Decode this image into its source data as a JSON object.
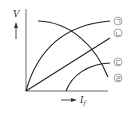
{
  "diagram": {
    "y_axis_label": "V",
    "x_axis_label_main": "I",
    "x_axis_label_sub": "f",
    "curves": [
      {
        "id": "a",
        "label": "ㄱ",
        "shape": "rising concave from origin"
      },
      {
        "id": "b",
        "label": "ㄴ",
        "shape": "straight line from origin"
      },
      {
        "id": "c",
        "label": "ㄷ",
        "shape": "rising concave from offset on x-axis"
      },
      {
        "id": "d",
        "label": "ㄹ",
        "shape": "falling curve"
      }
    ],
    "colors": {
      "line": "#222222",
      "text": "#333333"
    }
  }
}
